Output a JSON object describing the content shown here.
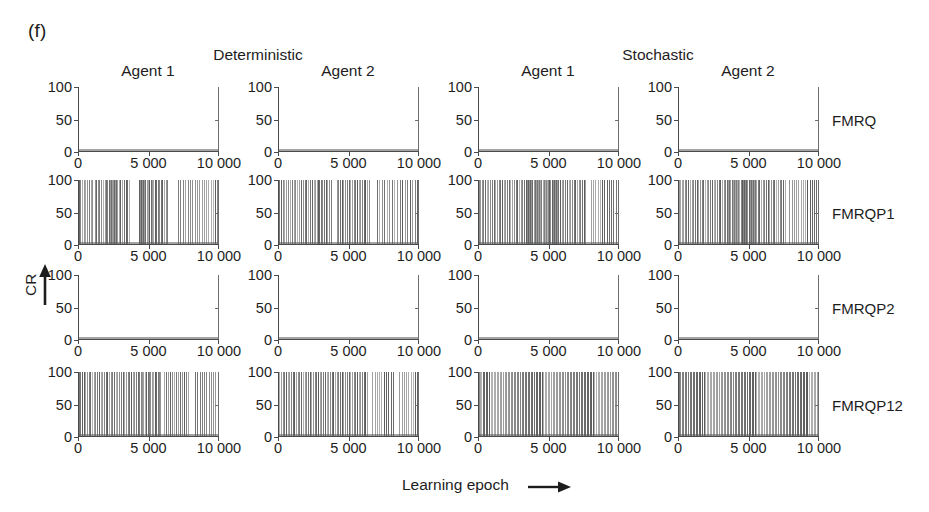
{
  "figure": {
    "panel_letter": "(f)",
    "axis_titles": {
      "y": "CR",
      "x": "Learning epoch",
      "x_arrow": "right-arrow",
      "y_arrow": "up-arrow"
    },
    "groups": [
      {
        "label": "Deterministic"
      },
      {
        "label": "Stochastic"
      }
    ],
    "columns": [
      {
        "label": "Agent 1",
        "group": "Deterministic"
      },
      {
        "label": "Agent 2",
        "group": "Deterministic"
      },
      {
        "label": "Agent 1",
        "group": "Stochastic"
      },
      {
        "label": "Agent 2",
        "group": "Stochastic"
      }
    ],
    "rows": [
      {
        "label": "FMRQ"
      },
      {
        "label": "FMRQP1"
      },
      {
        "label": "FMRQP2"
      },
      {
        "label": "FMRQP12"
      }
    ],
    "ink_color": "#5a5a5a",
    "axis_color": "#4a4a4a"
  },
  "chart_data": {
    "type": "line",
    "title": "(f)",
    "xlabel": "Learning epoch",
    "ylabel": "CR",
    "xlim": [
      0,
      10000
    ],
    "ylim": [
      0,
      100
    ],
    "xticks": [
      0,
      5000,
      10000
    ],
    "xticklabels": [
      "0",
      "5 000",
      "10 000"
    ],
    "yticks": [
      0,
      50,
      100
    ],
    "yticklabels": [
      "0",
      "50",
      "100"
    ],
    "grid": false,
    "legend": false,
    "grid_layout": {
      "rows": 4,
      "cols": 4
    },
    "row_labels": [
      "FMRQ",
      "FMRQP1",
      "FMRQP2",
      "FMRQP12"
    ],
    "column_labels": [
      "Agent 1",
      "Agent 2",
      "Agent 1",
      "Agent 2"
    ],
    "group_labels": [
      "Deterministic",
      "Deterministic",
      "Stochastic",
      "Stochastic"
    ],
    "panels": [
      {
        "row": "FMRQ",
        "column": "Agent 1",
        "group": "Deterministic",
        "spike_epochs": []
      },
      {
        "row": "FMRQ",
        "column": "Agent 2",
        "group": "Deterministic",
        "spike_epochs": []
      },
      {
        "row": "FMRQ",
        "column": "Agent 1",
        "group": "Stochastic",
        "spike_epochs": []
      },
      {
        "row": "FMRQ",
        "column": "Agent 2",
        "group": "Stochastic",
        "spike_epochs": []
      },
      {
        "row": "FMRQP1",
        "column": "Agent 1",
        "group": "Deterministic",
        "spike_epochs": [
          70,
          160,
          300,
          420,
          520,
          640,
          760,
          900,
          1020,
          1180,
          1260,
          1400,
          1520,
          1620,
          1760,
          1880,
          1960,
          2060,
          2180,
          2260,
          2340,
          2420,
          2480,
          2560,
          2640,
          2720,
          2800,
          2900,
          3000,
          3120,
          3260,
          3380,
          3480,
          3600,
          4300,
          4380,
          4460,
          4540,
          4620,
          4700,
          4780,
          4860,
          4960,
          5060,
          5160,
          5240,
          5340,
          5440,
          5540,
          5640,
          5740,
          5860,
          5980,
          6100,
          6220,
          6340,
          7100,
          7260,
          7420,
          7620,
          7800,
          7960,
          8120,
          8280,
          8440,
          8600,
          8760,
          8920,
          9080,
          9240,
          9400,
          9560,
          9720,
          9860,
          9960
        ]
      },
      {
        "row": "FMRQP1",
        "column": "Agent 2",
        "group": "Deterministic",
        "spike_epochs": [
          60,
          180,
          320,
          460,
          580,
          700,
          840,
          980,
          1120,
          1240,
          1380,
          1500,
          1640,
          1780,
          1900,
          2020,
          2140,
          2280,
          2400,
          2520,
          2640,
          2740,
          2840,
          2940,
          3040,
          3140,
          3260,
          3380,
          3500,
          3620,
          3740,
          4160,
          4280,
          4400,
          4520,
          4640,
          4760,
          4880,
          5000,
          5120,
          5240,
          5360,
          5480,
          5600,
          5720,
          5840,
          5960,
          6080,
          6200,
          6320,
          6440,
          7000,
          7180,
          7360,
          7540,
          7720,
          7900,
          8080,
          8260,
          8440,
          8620,
          8800,
          8980,
          9160,
          9340,
          9520,
          9700,
          9880,
          9970
        ]
      },
      {
        "row": "FMRQP1",
        "column": "Agent 1",
        "group": "Stochastic",
        "spike_epochs": [
          50,
          150,
          260,
          380,
          500,
          620,
          740,
          860,
          980,
          1100,
          1220,
          1340,
          1460,
          1580,
          1700,
          1820,
          1940,
          2060,
          2180,
          2300,
          2420,
          2540,
          2660,
          2780,
          2900,
          3020,
          3140,
          3260,
          3380,
          3460,
          3540,
          3620,
          3700,
          3780,
          3860,
          3940,
          4020,
          4100,
          4180,
          4260,
          4340,
          4420,
          4500,
          4580,
          4660,
          4740,
          4820,
          4900,
          4980,
          5060,
          5140,
          5220,
          5300,
          5380,
          5460,
          5540,
          5620,
          5700,
          5820,
          5940,
          6060,
          6180,
          6300,
          6420,
          6540,
          6660,
          6780,
          6900,
          7020,
          7140,
          7260,
          7380,
          7500,
          7620,
          8000,
          8160,
          8320,
          8480,
          8640,
          8800,
          8960,
          9120,
          9280,
          9440,
          9600,
          9760,
          9920
        ]
      },
      {
        "row": "FMRQP1",
        "column": "Agent 2",
        "group": "Stochastic",
        "spike_epochs": [
          40,
          140,
          250,
          360,
          480,
          600,
          720,
          840,
          960,
          1080,
          1200,
          1320,
          1440,
          1560,
          1680,
          1800,
          1920,
          2040,
          2160,
          2280,
          2400,
          2520,
          2640,
          2760,
          2880,
          3000,
          3120,
          3240,
          3360,
          3480,
          3560,
          3640,
          3720,
          3800,
          3880,
          3960,
          4040,
          4120,
          4200,
          4280,
          4360,
          4440,
          4520,
          4600,
          4680,
          4760,
          4840,
          4920,
          5000,
          5080,
          5160,
          5240,
          5320,
          5400,
          5480,
          5560,
          5640,
          5760,
          5880,
          6000,
          6120,
          6240,
          6360,
          6480,
          6600,
          6720,
          6840,
          6960,
          7080,
          7200,
          7320,
          7440,
          7560,
          7900,
          8060,
          8220,
          8380,
          8540,
          8700,
          8860,
          9020,
          9180,
          9340,
          9500,
          9660,
          9820,
          9950
        ]
      },
      {
        "row": "FMRQP2",
        "column": "Agent 1",
        "group": "Deterministic",
        "spike_epochs": []
      },
      {
        "row": "FMRQP2",
        "column": "Agent 2",
        "group": "Deterministic",
        "spike_epochs": []
      },
      {
        "row": "FMRQP2",
        "column": "Agent 1",
        "group": "Stochastic",
        "spike_epochs": []
      },
      {
        "row": "FMRQP2",
        "column": "Agent 2",
        "group": "Stochastic",
        "spike_epochs": []
      },
      {
        "row": "FMRQP12",
        "column": "Agent 1",
        "group": "Deterministic",
        "spike_epochs": [
          60,
          170,
          290,
          400,
          520,
          640,
          760,
          880,
          1000,
          1120,
          1240,
          1360,
          1480,
          1600,
          1720,
          1840,
          1960,
          2080,
          2200,
          2320,
          2440,
          2560,
          2680,
          2800,
          2920,
          3040,
          3160,
          3280,
          3400,
          3520,
          3640,
          3760,
          3880,
          4000,
          4120,
          4240,
          4340,
          4440,
          4540,
          4640,
          4740,
          4840,
          4940,
          5040,
          5140,
          5240,
          5340,
          5440,
          5540,
          5640,
          5740,
          5840,
          6100,
          6240,
          6380,
          6520,
          6660,
          6800,
          6940,
          7080,
          7220,
          7360,
          7500,
          7640,
          7780,
          8300,
          8460,
          8620,
          8780,
          8940,
          9100,
          9260,
          9420,
          9580,
          9740,
          9900
        ]
      },
      {
        "row": "FMRQP12",
        "column": "Agent 2",
        "group": "Deterministic",
        "spike_epochs": [
          80,
          200,
          320,
          440,
          560,
          680,
          800,
          920,
          1040,
          1160,
          1280,
          1400,
          1520,
          1640,
          1760,
          1880,
          2000,
          2120,
          2240,
          2360,
          2480,
          2600,
          2720,
          2840,
          2960,
          3080,
          3200,
          3320,
          3440,
          3560,
          3680,
          3800,
          3920,
          4040,
          4160,
          4280,
          4400,
          4520,
          4640,
          4760,
          4880,
          5000,
          5120,
          5240,
          5360,
          5480,
          5600,
          5720,
          5840,
          5960,
          6080,
          6200,
          6320,
          6700,
          6860,
          7020,
          7180,
          7340,
          7500,
          7660,
          7820,
          7980,
          8140,
          8600,
          8760,
          8920,
          9080,
          9240,
          9400,
          9560,
          9720,
          9880
        ]
      },
      {
        "row": "FMRQP12",
        "column": "Agent 1",
        "group": "Stochastic",
        "spike_epochs": [
          50,
          140,
          240,
          340,
          450,
          560,
          670,
          780,
          890,
          1000,
          1110,
          1220,
          1330,
          1440,
          1550,
          1660,
          1770,
          1880,
          1990,
          2100,
          2210,
          2320,
          2430,
          2540,
          2650,
          2760,
          2870,
          2980,
          3090,
          3200,
          3310,
          3420,
          3530,
          3640,
          3750,
          3860,
          3970,
          4080,
          4190,
          4300,
          4410,
          4520,
          4630,
          4740,
          4850,
          4960,
          5070,
          5180,
          5290,
          5400,
          5510,
          5620,
          5730,
          5840,
          5950,
          6060,
          6170,
          6280,
          6390,
          6500,
          6610,
          6720,
          6830,
          6940,
          7050,
          7160,
          7270,
          7380,
          7490,
          7600,
          7710,
          7820,
          7930,
          8040,
          8150,
          8260,
          8370,
          8480,
          8590,
          8700,
          8810,
          8920,
          9030,
          9140,
          9250,
          9360,
          9470,
          9580,
          9690,
          9800,
          9910
        ]
      },
      {
        "row": "FMRQP12",
        "column": "Agent 2",
        "group": "Stochastic",
        "spike_epochs": [
          60,
          160,
          270,
          380,
          490,
          600,
          710,
          820,
          930,
          1040,
          1150,
          1260,
          1370,
          1480,
          1590,
          1700,
          1810,
          1920,
          2030,
          2140,
          2250,
          2360,
          2470,
          2580,
          2690,
          2800,
          2910,
          3020,
          3130,
          3240,
          3350,
          3460,
          3570,
          3680,
          3790,
          3900,
          4010,
          4120,
          4230,
          4340,
          4450,
          4560,
          4670,
          4780,
          4890,
          5000,
          5110,
          5220,
          5330,
          5440,
          5550,
          5660,
          5770,
          5880,
          5990,
          6100,
          6210,
          6320,
          6430,
          6540,
          6650,
          6760,
          6870,
          6980,
          7090,
          7200,
          7310,
          7420,
          7530,
          7640,
          7750,
          7860,
          7970,
          8080,
          8190,
          8300,
          8410,
          8520,
          8630,
          8740,
          8850,
          8960,
          9070,
          9180,
          9290,
          9400,
          9510,
          9620,
          9730,
          9840,
          9950
        ]
      }
    ]
  }
}
